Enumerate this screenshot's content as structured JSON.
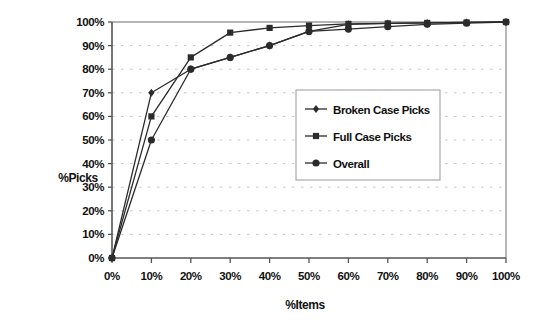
{
  "chart_data": {
    "type": "line",
    "title": "",
    "xlabel": "%Items",
    "ylabel": "%Picks",
    "xlim": [
      0,
      100
    ],
    "ylim": [
      0,
      100
    ],
    "grid": true,
    "grid_style": "dotted-horizontal",
    "legend_position": "center-right",
    "x": [
      0,
      10,
      20,
      30,
      40,
      50,
      60,
      70,
      80,
      90,
      100
    ],
    "xtick_labels": [
      "0%",
      "10%",
      "20%",
      "30%",
      "40%",
      "50%",
      "60%",
      "70%",
      "80%",
      "90%",
      "100%"
    ],
    "ytick_labels": [
      "0%",
      "10%",
      "20%",
      "30%",
      "40%",
      "50%",
      "60%",
      "70%",
      "80%",
      "90%",
      "100%"
    ],
    "ytick_values": [
      0,
      10,
      20,
      30,
      40,
      50,
      60,
      70,
      80,
      90,
      100
    ],
    "series": [
      {
        "name": "Broken Case Picks",
        "marker": "diamond",
        "color": "#2b2b2b",
        "values": [
          0,
          70,
          80,
          85,
          90,
          96,
          99,
          99.4,
          99.6,
          99.8,
          100
        ]
      },
      {
        "name": "Full Case Picks",
        "marker": "square",
        "color": "#2b2b2b",
        "values": [
          0,
          60,
          85,
          95.5,
          97.5,
          98.5,
          99.2,
          99.4,
          99.6,
          99.8,
          100
        ]
      },
      {
        "name": "Overall",
        "marker": "circle",
        "color": "#2b2b2b",
        "values": [
          0,
          50,
          80,
          85,
          90,
          96,
          97,
          98,
          99,
          99.5,
          100
        ]
      }
    ]
  },
  "axes": {
    "y_title": "%Picks",
    "x_title": "%Items"
  },
  "legend": {
    "entries": [
      {
        "label": "Broken Case Picks",
        "marker": "diamond"
      },
      {
        "label": "Full Case Picks",
        "marker": "square"
      },
      {
        "label": "Overall",
        "marker": "circle"
      }
    ]
  },
  "colors": {
    "series": "#2b2b2b",
    "axis": "#555555",
    "grid": "#c8c8c8",
    "plot_border": "#9a9a9a",
    "legend_border": "#999999",
    "background": "#ffffff"
  }
}
